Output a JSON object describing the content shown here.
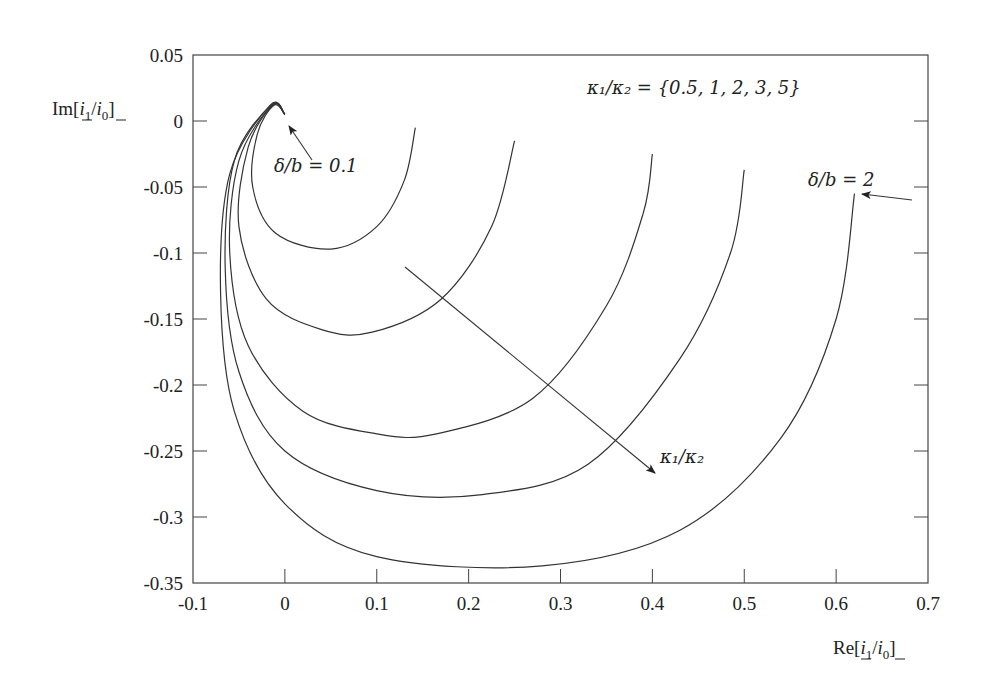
{
  "chart_data": {
    "type": "line",
    "title": "",
    "xlabel": "Re[i_1/i_0]",
    "ylabel": "Im[i_1/i_0]",
    "xlim": [
      -0.1,
      0.7
    ],
    "ylim": [
      -0.35,
      0.05
    ],
    "x_ticks": [
      "-0.1",
      "0",
      "0.1",
      "0.2",
      "0.3",
      "0.4",
      "0.5",
      "0.6",
      "0.7"
    ],
    "y_ticks": [
      "0.05",
      "0",
      "-0.05",
      "-0.1",
      "-0.15",
      "-0.2",
      "-0.25",
      "-0.3",
      "-0.35"
    ],
    "grid": false,
    "legend": null,
    "parameter_label": "κ1/κ2 = {0.5, 1, 2, 3, 5}",
    "series": [
      {
        "name": "κ1/κ2 = 0.5",
        "points": [
          [
            0.0,
            0.005
          ],
          [
            -0.012,
            0.012
          ],
          [
            -0.03,
            -0.01
          ],
          [
            -0.035,
            -0.05
          ],
          [
            -0.01,
            -0.085
          ],
          [
            0.05,
            -0.097
          ],
          [
            0.1,
            -0.08
          ],
          [
            0.13,
            -0.045
          ],
          [
            0.142,
            -0.005
          ]
        ]
      },
      {
        "name": "κ1/κ2 = 1",
        "points": [
          [
            0.0,
            0.005
          ],
          [
            -0.013,
            0.012
          ],
          [
            -0.04,
            -0.02
          ],
          [
            -0.05,
            -0.08
          ],
          [
            -0.02,
            -0.135
          ],
          [
            0.04,
            -0.158
          ],
          [
            0.095,
            -0.16
          ],
          [
            0.17,
            -0.135
          ],
          [
            0.225,
            -0.08
          ],
          [
            0.25,
            -0.015
          ]
        ]
      },
      {
        "name": "κ1/κ2 = 2",
        "points": [
          [
            0.0,
            0.005
          ],
          [
            -0.014,
            0.012
          ],
          [
            -0.05,
            -0.03
          ],
          [
            -0.06,
            -0.1
          ],
          [
            -0.04,
            -0.17
          ],
          [
            0.02,
            -0.22
          ],
          [
            0.1,
            -0.237
          ],
          [
            0.165,
            -0.237
          ],
          [
            0.27,
            -0.21
          ],
          [
            0.35,
            -0.14
          ],
          [
            0.39,
            -0.07
          ],
          [
            0.4,
            -0.025
          ]
        ]
      },
      {
        "name": "κ1/κ2 = 3",
        "points": [
          [
            0.0,
            0.005
          ],
          [
            -0.015,
            0.012
          ],
          [
            -0.055,
            -0.03
          ],
          [
            -0.065,
            -0.11
          ],
          [
            -0.05,
            -0.19
          ],
          [
            0.0,
            -0.25
          ],
          [
            0.1,
            -0.28
          ],
          [
            0.215,
            -0.283
          ],
          [
            0.33,
            -0.26
          ],
          [
            0.43,
            -0.18
          ],
          [
            0.485,
            -0.1
          ],
          [
            0.5,
            -0.037
          ]
        ]
      },
      {
        "name": "κ1/κ2 = 5",
        "points": [
          [
            0.0,
            0.005
          ],
          [
            -0.016,
            0.012
          ],
          [
            -0.06,
            -0.04
          ],
          [
            -0.07,
            -0.13
          ],
          [
            -0.055,
            -0.22
          ],
          [
            0.0,
            -0.29
          ],
          [
            0.1,
            -0.33
          ],
          [
            0.28,
            -0.337
          ],
          [
            0.43,
            -0.31
          ],
          [
            0.54,
            -0.24
          ],
          [
            0.6,
            -0.15
          ],
          [
            0.62,
            -0.055
          ]
        ]
      }
    ],
    "annotations": [
      {
        "text": "δ/b = 0.1",
        "x": 0.01,
        "y": -0.04,
        "arrow_to": [
          0.0,
          0.003
        ]
      },
      {
        "text": "δ/b = 2",
        "x": 0.6,
        "y": -0.045,
        "arrow_from": [
          0.69,
          -0.06
        ],
        "arrow_to": [
          0.63,
          -0.05
        ]
      },
      {
        "text": "κ1/κ2",
        "x": 0.43,
        "y": -0.25,
        "arrow_from": [
          0.17,
          -0.11
        ],
        "arrow_to": [
          0.43,
          -0.26
        ]
      }
    ]
  },
  "labels": {
    "ylabel_prefix": "Im[",
    "xlabel_prefix": "Re[",
    "i": "i",
    "sub1": "1",
    "sub0": "0",
    "slash": "/",
    "close": "]",
    "param_text": "κ₁/κ₂ = {0.5, 1, 2, 3, 5}",
    "delta_small": "δ/b = 0.1",
    "delta_large": "δ/b = 2",
    "kappa_arrow": "κ₁/κ₂"
  }
}
